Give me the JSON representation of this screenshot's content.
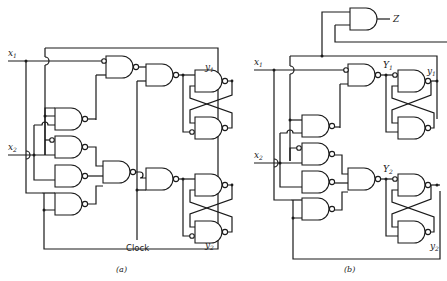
{
  "figure": {
    "panel_a": {
      "caption": "(a)",
      "inputs": [
        {
          "label": "x",
          "subscript": "1"
        },
        {
          "label": "x",
          "subscript": "2"
        }
      ],
      "outputs": [
        {
          "label": "y",
          "subscript": "1"
        },
        {
          "label": "y",
          "subscript": "2"
        }
      ],
      "clock_label": "Clock"
    },
    "panel_b": {
      "caption": "(b)",
      "inputs": [
        {
          "label": "x",
          "subscript": "1"
        },
        {
          "label": "x",
          "subscript": "2"
        }
      ],
      "excitations": [
        {
          "label": "Y",
          "subscript": "1"
        },
        {
          "label": "Y",
          "subscript": "2"
        }
      ],
      "outputs": [
        {
          "label": "y",
          "subscript": "1"
        },
        {
          "label": "y",
          "subscript": "2"
        }
      ],
      "z_output": "Z"
    }
  }
}
